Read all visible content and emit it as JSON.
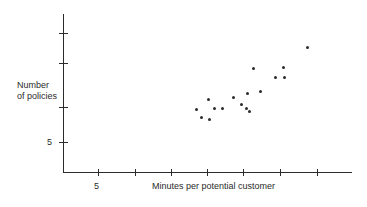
{
  "chart_data": {
    "type": "scatter",
    "title": "",
    "xlabel": "Minutes per potential customer",
    "ylabel": "Number of policies",
    "ylabel_lines": [
      "Number",
      "of policies"
    ],
    "x_tick_labels": [
      "5"
    ],
    "y_tick_labels": [
      "5"
    ],
    "xlim": [
      0,
      40
    ],
    "ylim": [
      0,
      30
    ],
    "grid": false,
    "legend": null,
    "marker": "filled-circle",
    "marker_color": "#2b2b2b",
    "points": [
      {
        "x": 18.3,
        "y": 9.6
      },
      {
        "x": 19.3,
        "y": 8.2
      },
      {
        "x": 20.4,
        "y": 11.0
      },
      {
        "x": 21.0,
        "y": 7.3
      },
      {
        "x": 21.9,
        "y": 9.6
      },
      {
        "x": 23.4,
        "y": 9.7
      },
      {
        "x": 25.1,
        "y": 11.2
      },
      {
        "x": 26.2,
        "y": 10.2
      },
      {
        "x": 26.9,
        "y": 9.5
      },
      {
        "x": 27.2,
        "y": 13.0
      },
      {
        "x": 27.6,
        "y": 9.0
      },
      {
        "x": 28.0,
        "y": 15.2
      },
      {
        "x": 29.5,
        "y": 12.6
      },
      {
        "x": 32.0,
        "y": 14.3
      },
      {
        "x": 33.2,
        "y": 15.3
      },
      {
        "x": 33.3,
        "y": 14.3
      },
      {
        "x": 36.5,
        "y": 18.5
      }
    ],
    "pixel_points": [
      {
        "left": 195,
        "top": 108
      },
      {
        "left": 200,
        "top": 116
      },
      {
        "left": 207,
        "top": 98
      },
      {
        "left": 208,
        "top": 118
      },
      {
        "left": 213,
        "top": 107
      },
      {
        "left": 221,
        "top": 107
      },
      {
        "left": 232,
        "top": 96
      },
      {
        "left": 240,
        "top": 103
      },
      {
        "left": 245,
        "top": 107
      },
      {
        "left": 246,
        "top": 92
      },
      {
        "left": 248,
        "top": 110
      },
      {
        "left": 252,
        "top": 67
      },
      {
        "left": 259,
        "top": 90
      },
      {
        "left": 274,
        "top": 76
      },
      {
        "left": 282,
        "top": 66
      },
      {
        "left": 283,
        "top": 76
      },
      {
        "left": 306,
        "top": 46
      }
    ],
    "x_tick_positions": [
      98,
      135,
      171,
      207,
      243,
      280,
      317
    ],
    "y_tick_positions": [
      33,
      63,
      107,
      142
    ]
  }
}
